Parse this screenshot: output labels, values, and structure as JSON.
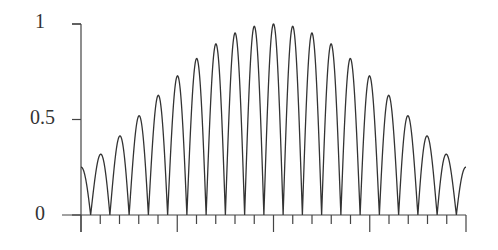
{
  "chart_data": {
    "type": "line",
    "title": "",
    "xlabel": "",
    "ylabel": "",
    "ylim": [
      0,
      1
    ],
    "xlim": [
      -1,
      1
    ],
    "y_ticks": [
      "0",
      "0.5",
      "1"
    ],
    "x_major_ticks": [
      -1,
      -0.5,
      0,
      0.5,
      1
    ],
    "x_minor_ticks_per_major": 5,
    "grid": false,
    "legend": null,
    "series": [
      {
        "name": "signal",
        "description": "Rectified oscillation |cos(pi*x*10)| under a smooth envelope peaking at 1 at x=0, ~0.25 at the ends",
        "peak_values": [
          0.34,
          0.44,
          0.54,
          0.64,
          0.73,
          0.82,
          0.89,
          0.95,
          0.99,
          1.0,
          0.99,
          0.95,
          0.89,
          0.82,
          0.73,
          0.64,
          0.54,
          0.44,
          0.34
        ],
        "end_values": [
          0.25,
          0.25
        ],
        "color": "#333333"
      }
    ]
  },
  "axis": {
    "y_labels": [
      "1",
      "0.5",
      "0"
    ]
  }
}
